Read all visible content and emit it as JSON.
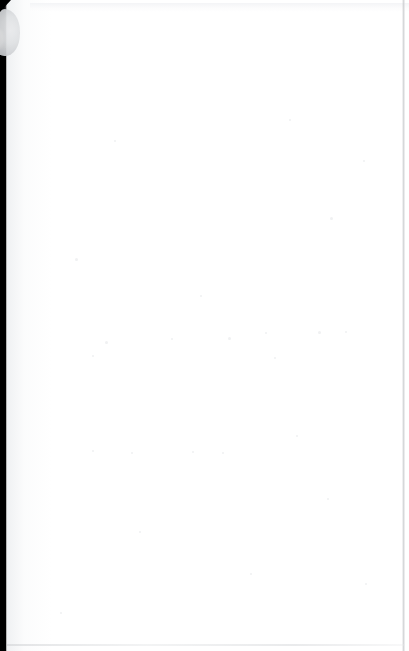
{
  "document": {
    "kind": "scanned-page",
    "content_state": "blank",
    "page_width_px": 409,
    "page_height_px": 651,
    "visible_text": "",
    "note": "Blank scanned page — no printed text, headings, figures or page number are visible."
  },
  "colors": {
    "page_background": "#ffffff",
    "binding_shadow": "#000000",
    "gutter_tone": "#eceef0",
    "thumb_artifact": "#cfd1d4",
    "edge_rule": "#c4c6c9",
    "noise_speck": "#e2e3e5"
  },
  "artifacts": {
    "binding_shadow": {
      "name": "binding-shadow",
      "edge": "left",
      "x": 0,
      "y": 0,
      "width": 7,
      "height": 651
    },
    "corner_wedge": {
      "name": "corner-wedge",
      "edge": "top-left",
      "x": 0,
      "y": 0,
      "width": 11,
      "height": 12
    },
    "thumb": {
      "name": "thumb-artifact",
      "edge": "left",
      "x": 2,
      "y": 9,
      "width": 18,
      "height": 47
    },
    "edge_rules": [
      {
        "name": "edge-rule-top",
        "edge": "top",
        "y": 3
      },
      {
        "name": "edge-rule-right",
        "edge": "right",
        "x": 403
      },
      {
        "name": "edge-rule-bottom",
        "edge": "bottom",
        "y": 644
      }
    ]
  },
  "noise_specks": [
    {
      "x": 114,
      "y": 140,
      "size": 2
    },
    {
      "x": 289,
      "y": 119,
      "size": 2
    },
    {
      "x": 330,
      "y": 217,
      "size": 3
    },
    {
      "x": 363,
      "y": 160,
      "size": 2
    },
    {
      "x": 75,
      "y": 258,
      "size": 3
    },
    {
      "x": 200,
      "y": 295,
      "size": 2
    },
    {
      "x": 265,
      "y": 332,
      "size": 2
    },
    {
      "x": 318,
      "y": 331,
      "size": 3
    },
    {
      "x": 345,
      "y": 331,
      "size": 2
    },
    {
      "x": 105,
      "y": 341,
      "size": 3
    },
    {
      "x": 171,
      "y": 338,
      "size": 2
    },
    {
      "x": 228,
      "y": 337,
      "size": 3
    },
    {
      "x": 92,
      "y": 355,
      "size": 2
    },
    {
      "x": 274,
      "y": 357,
      "size": 2
    },
    {
      "x": 296,
      "y": 435,
      "size": 2
    },
    {
      "x": 92,
      "y": 450,
      "size": 2
    },
    {
      "x": 192,
      "y": 451,
      "size": 2
    },
    {
      "x": 131,
      "y": 452,
      "size": 2
    },
    {
      "x": 222,
      "y": 452,
      "size": 2
    },
    {
      "x": 327,
      "y": 498,
      "size": 2
    },
    {
      "x": 139,
      "y": 531,
      "size": 2
    },
    {
      "x": 250,
      "y": 573,
      "size": 2
    },
    {
      "x": 365,
      "y": 583,
      "size": 2
    },
    {
      "x": 60,
      "y": 612,
      "size": 2
    }
  ]
}
